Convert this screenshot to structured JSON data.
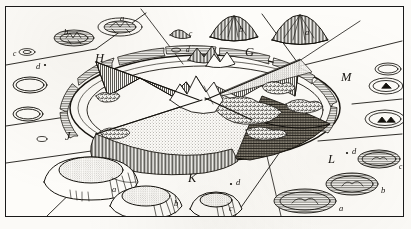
{
  "plate": {
    "title": "Sectional diagram of a lunar ring-mountain with surrounding specimen figures",
    "medium": "engraving",
    "ink_color": "#15120e",
    "paper_color": "#fdfcf9",
    "frame_color": "#1a1a1a",
    "width": 411,
    "height": 229
  },
  "central_figure": {
    "name": "sectioned crater",
    "description": "large elliptical walled plain cut open into radial sectors showing interior structure, central peak cluster and terraced rampart",
    "sector_labels": [
      {
        "key": "G",
        "text": "G",
        "x": 245,
        "y": 46,
        "region": "north-east inner wall"
      },
      {
        "key": "H",
        "text": "H",
        "x": 95,
        "y": 52,
        "region": "north-west inner wall"
      },
      {
        "key": "J",
        "text": "J",
        "x": 65,
        "y": 130,
        "region": "west outer rampart"
      },
      {
        "key": "K",
        "text": "K",
        "x": 188,
        "y": 172,
        "region": "south terraced glacis"
      },
      {
        "key": "L",
        "text": "L",
        "x": 328,
        "y": 153,
        "region": "south-east dark floor"
      },
      {
        "key": "M",
        "text": "M",
        "x": 341,
        "y": 71,
        "region": "east outer rampart"
      }
    ]
  },
  "specimens": {
    "top_left_group": [
      {
        "text": "b",
        "x": 64,
        "y": 28,
        "form": "flat ringed crater, plan view"
      },
      {
        "text": "a",
        "x": 120,
        "y": 14,
        "form": "ringed crater with radial streaks, plan view"
      },
      {
        "text": "c",
        "x": 13,
        "y": 50,
        "form": "small ring pit"
      },
      {
        "text": "d",
        "x": 36,
        "y": 65,
        "form": "minute pit point"
      }
    ],
    "top_centre_group": [
      {
        "text": "c",
        "x": 188,
        "y": 31,
        "form": "low dome"
      },
      {
        "text": "d",
        "x": 188,
        "y": 48,
        "form": "minute dome"
      }
    ],
    "top_right_group": [
      {
        "text": "b",
        "x": 238,
        "y": 26,
        "form": "cinder cone, profile"
      },
      {
        "text": "a",
        "x": 305,
        "y": 30,
        "form": "large cinder cone, profile"
      }
    ],
    "right_group": [
      {
        "text": "",
        "x": 0,
        "y": 0,
        "form": "plain ring, plan view"
      },
      {
        "text": "",
        "x": 0,
        "y": 0,
        "form": "ring with central peak, plan view"
      },
      {
        "text": "",
        "x": 0,
        "y": 0,
        "form": "ring with twin peaks, plan view"
      }
    ],
    "bottom_left_group": [
      {
        "text": "a",
        "x": 112,
        "y": 186,
        "form": "truncated cone crater, profile"
      },
      {
        "text": "b",
        "x": 175,
        "y": 200,
        "form": "smaller truncated cone, profile"
      },
      {
        "text": "c",
        "x": 230,
        "y": 206,
        "form": "small dome crater, profile"
      }
    ],
    "bottom_centre_group": [
      {
        "text": "d",
        "x": 238,
        "y": 183,
        "form": "minute pit point"
      }
    ],
    "bottom_right_group": [
      {
        "text": "d",
        "x": 354,
        "y": 152,
        "form": "minute pit point"
      },
      {
        "text": "c",
        "x": 398,
        "y": 167,
        "form": "shaded ellipse crater"
      },
      {
        "text": "b",
        "x": 383,
        "y": 189,
        "form": "shaded ellipse crater"
      },
      {
        "text": "a",
        "x": 340,
        "y": 204,
        "form": "large shaded ellipse crater"
      }
    ]
  }
}
